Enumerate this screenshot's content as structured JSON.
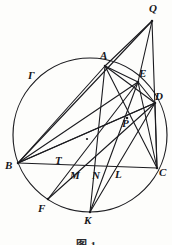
{
  "figure": {
    "caption": "图 1",
    "circle_label": "Γ",
    "type": "euclidean-geometry-circle-diagram",
    "stroke_color": "#1b1b1f",
    "background_color": "#fdfdfb",
    "width": 172,
    "height": 245
  },
  "circle": {
    "name": "Γ",
    "cx": 90,
    "cy": 135,
    "r": 77
  },
  "center_dot": {
    "x": 87,
    "y": 139
  },
  "points": [
    {
      "id": "Q",
      "label": "Q",
      "x": 152,
      "y": 21,
      "label_x": 149,
      "label_y": 3,
      "on_circle": false
    },
    {
      "id": "A",
      "label": "A",
      "x": 105,
      "y": 66,
      "label_x": 100,
      "label_y": 50,
      "on_circle": true
    },
    {
      "id": "E",
      "label": "E",
      "x": 138,
      "y": 82,
      "label_x": 139,
      "label_y": 68,
      "on_circle": true
    },
    {
      "id": "D",
      "label": "D",
      "x": 155,
      "y": 103,
      "label_x": 155,
      "label_y": 91,
      "on_circle": true
    },
    {
      "id": "P",
      "label": "P",
      "x": 127,
      "y": 118,
      "label_x": 122,
      "label_y": 118,
      "on_circle": false
    },
    {
      "id": "B",
      "label": "B",
      "x": 18,
      "y": 163,
      "label_x": 5,
      "label_y": 160,
      "on_circle": true
    },
    {
      "id": "C",
      "label": "C",
      "x": 157,
      "y": 168,
      "label_x": 159,
      "label_y": 167,
      "on_circle": true
    },
    {
      "id": "T",
      "label": "T",
      "x": 61,
      "y": 168,
      "label_x": 55,
      "label_y": 155,
      "on_circle": false
    },
    {
      "id": "M",
      "label": "M",
      "x": 76,
      "y": 168,
      "label_x": 70,
      "label_y": 170,
      "on_circle": false
    },
    {
      "id": "N",
      "label": "N",
      "x": 98,
      "y": 168,
      "label_x": 92,
      "label_y": 170,
      "on_circle": false
    },
    {
      "id": "L",
      "label": "L",
      "x": 121,
      "y": 168,
      "label_x": 115,
      "label_y": 169,
      "on_circle": false
    },
    {
      "id": "F",
      "label": "F",
      "x": 48,
      "y": 199,
      "label_x": 38,
      "label_y": 203,
      "on_circle": true
    },
    {
      "id": "K",
      "label": "K",
      "x": 90,
      "y": 212,
      "label_x": 84,
      "label_y": 215,
      "on_circle": true
    }
  ],
  "gamma_label": {
    "text": "Γ",
    "x": 28,
    "y": 70
  },
  "segments": [
    {
      "from": "B",
      "to": "C",
      "name": "chord-BC"
    },
    {
      "from": "B",
      "to": "A",
      "name": "chord-BA"
    },
    {
      "from": "A",
      "to": "C",
      "name": "chord-AC"
    },
    {
      "from": "B",
      "to": "D",
      "name": "chord-BD"
    },
    {
      "from": "B",
      "to": "E",
      "name": "chord-BE"
    },
    {
      "from": "A",
      "to": "D",
      "name": "chord-AD"
    },
    {
      "from": "A",
      "to": "E",
      "name": "chord-AE"
    },
    {
      "from": "A",
      "to": "K",
      "name": "chord-AK"
    },
    {
      "from": "A",
      "to": "Q",
      "name": "line-AQ"
    },
    {
      "from": "B",
      "to": "Q",
      "name": "line-BQ"
    },
    {
      "from": "Q",
      "to": "C",
      "name": "line-QC"
    },
    {
      "from": "Q",
      "to": "E",
      "name": "line-QE"
    },
    {
      "from": "E",
      "to": "C",
      "name": "chord-EC"
    },
    {
      "from": "E",
      "to": "D",
      "name": "chord-ED"
    },
    {
      "from": "E",
      "to": "F",
      "name": "chord-EF"
    },
    {
      "from": "E",
      "to": "K",
      "name": "chord-EK"
    },
    {
      "from": "D",
      "to": "C",
      "name": "chord-DC"
    },
    {
      "from": "D",
      "to": "F",
      "name": "chord-DF"
    },
    {
      "from": "D",
      "to": "K",
      "name": "chord-DK"
    },
    {
      "from": "D",
      "to": "B",
      "name": "chord-DB-alt"
    }
  ]
}
